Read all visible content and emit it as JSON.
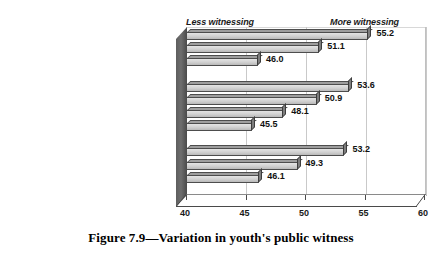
{
  "caption": "Figure 7.9—Variation in youth's public witness",
  "annotations": {
    "left": "Less witnessing",
    "right": "More witnessing"
  },
  "chart_data": {
    "type": "bar",
    "orientation": "horizontal",
    "title": "Figure 7.9—Variation in youth's public witness",
    "xlabel": "",
    "ylabel": "",
    "xlim": [
      40,
      60
    ],
    "xticks": [
      40,
      45,
      50,
      55,
      60
    ],
    "grid": true,
    "legend": false,
    "style": "3d-bar",
    "annotations": [
      "Less witnessing",
      "More witnessing"
    ],
    "groups": [
      {
        "name": "Youth group size",
        "categories": [
          "Youth groups more than 101",
          "Youth groups between 51 and 100",
          "Youth groups less than 40"
        ],
        "values": [
          55.2,
          51.1,
          46.0
        ]
      },
      {
        "name": "Approach",
        "categories": [
          "Approach is to protect youth",
          "Approach is to transform society",
          "Approach is community involvement",
          "Approach is to entertain"
        ],
        "values": [
          53.6,
          50.9,
          48.1,
          45.5
        ]
      },
      {
        "name": "Years in ministry",
        "categories": [
          "In ministry for 16 or more years",
          "In ministry for 4 to 9 years",
          "In ministry for 3 years or less"
        ],
        "values": [
          53.2,
          49.3,
          46.1
        ]
      }
    ],
    "categories": [
      "Youth groups more than 101",
      "Youth groups between 51 and 100",
      "Youth groups less than 40",
      "Approach is to protect youth",
      "Approach is to transform society",
      "Approach is community involvement",
      "Approach is to entertain",
      "In ministry for 16 or more years",
      "In ministry for 4 to 9 years",
      "In ministry for 3 years or less"
    ],
    "values": [
      55.2,
      51.1,
      46.0,
      53.6,
      50.9,
      48.1,
      45.5,
      53.2,
      49.3,
      46.1
    ],
    "value_labels": [
      "55.2",
      "51.1",
      "46.0",
      "53.6",
      "50.9",
      "48.1",
      "45.5",
      "53.2",
      "49.3",
      "46.1"
    ],
    "tick_labels": [
      "40",
      "45",
      "50",
      "55",
      "60"
    ],
    "colors": {
      "bar_face": "#d0d0d0",
      "bar_top": "#9e9e9e",
      "bar_outline": "#4d4d4d",
      "wall": "#5e5e5e",
      "grid": "#c9c9c9",
      "text": "#1a1a1a",
      "background": "#ffffff"
    }
  }
}
